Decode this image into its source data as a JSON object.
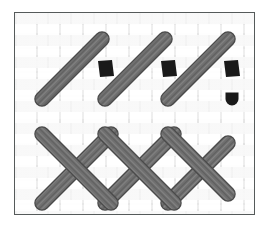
{
  "figure": {
    "width": 270,
    "height": 235
  },
  "colors": {
    "page_background": "#ffffff",
    "frame_border": "#555a5a",
    "fabric_light": "#ffffff",
    "fabric_mid": "#f2f2f2",
    "fabric_shadow": "#e6e6e6",
    "thread_fill": "#6e6e6e",
    "thread_highlight": "#8a8a8a",
    "thread_outline": "#4a4a4a",
    "hole_fill": "#1a1a1a"
  },
  "frame": {
    "x": 14,
    "y": 12,
    "width": 241,
    "height": 203,
    "border_width": 1.5,
    "label": "diagram frame"
  },
  "fabric": {
    "name": "basketweave canvas",
    "tile_width": 22,
    "tile_height": 11
  },
  "chart_data": {
    "type": "diagram",
    "upper_row": {
      "label": "parallel diagonal stitches",
      "count": 3,
      "angle_degrees": 45,
      "thread_width": 13,
      "stitches": [
        {
          "name": "stitch-1",
          "x1": 41,
          "y1": 98,
          "x2": 101,
          "y2": 38
        },
        {
          "name": "stitch-2",
          "x1": 104,
          "y1": 98,
          "x2": 164,
          "y2": 38
        },
        {
          "name": "stitch-3",
          "x1": 167,
          "y1": 98,
          "x2": 227,
          "y2": 38
        }
      ]
    },
    "holes": {
      "label": "needle entry holes",
      "count": 3,
      "width": 16,
      "height": 16,
      "skew_degrees": -8,
      "marks": [
        {
          "name": "hole-1",
          "cx": 105,
          "cy": 68
        },
        {
          "name": "hole-2",
          "cx": 168,
          "cy": 68
        },
        {
          "name": "hole-3",
          "cx": 231,
          "cy": 68
        }
      ]
    },
    "thread_tail": {
      "label": "thread end stub",
      "cx": 231,
      "cy": 98,
      "width": 13,
      "height": 13
    },
    "lower_band": {
      "label": "crossed lattice band",
      "thread_width": 13,
      "top_y": 133,
      "bottom_y": 202,
      "down_strokes": [
        {
          "name": "down-1",
          "x1": 41,
          "y1": 133,
          "x2": 110,
          "y2": 202
        },
        {
          "name": "down-2",
          "x1": 104,
          "y1": 133,
          "x2": 173,
          "y2": 202
        },
        {
          "name": "down-3",
          "x1": 167,
          "y1": 133,
          "x2": 227,
          "y2": 193
        }
      ],
      "up_strokes": [
        {
          "name": "up-1",
          "x1": 41,
          "y1": 202,
          "x2": 110,
          "y2": 133
        },
        {
          "name": "up-2",
          "x1": 104,
          "y1": 202,
          "x2": 173,
          "y2": 133
        },
        {
          "name": "up-3",
          "x1": 167,
          "y1": 202,
          "x2": 227,
          "y2": 142
        }
      ]
    }
  }
}
